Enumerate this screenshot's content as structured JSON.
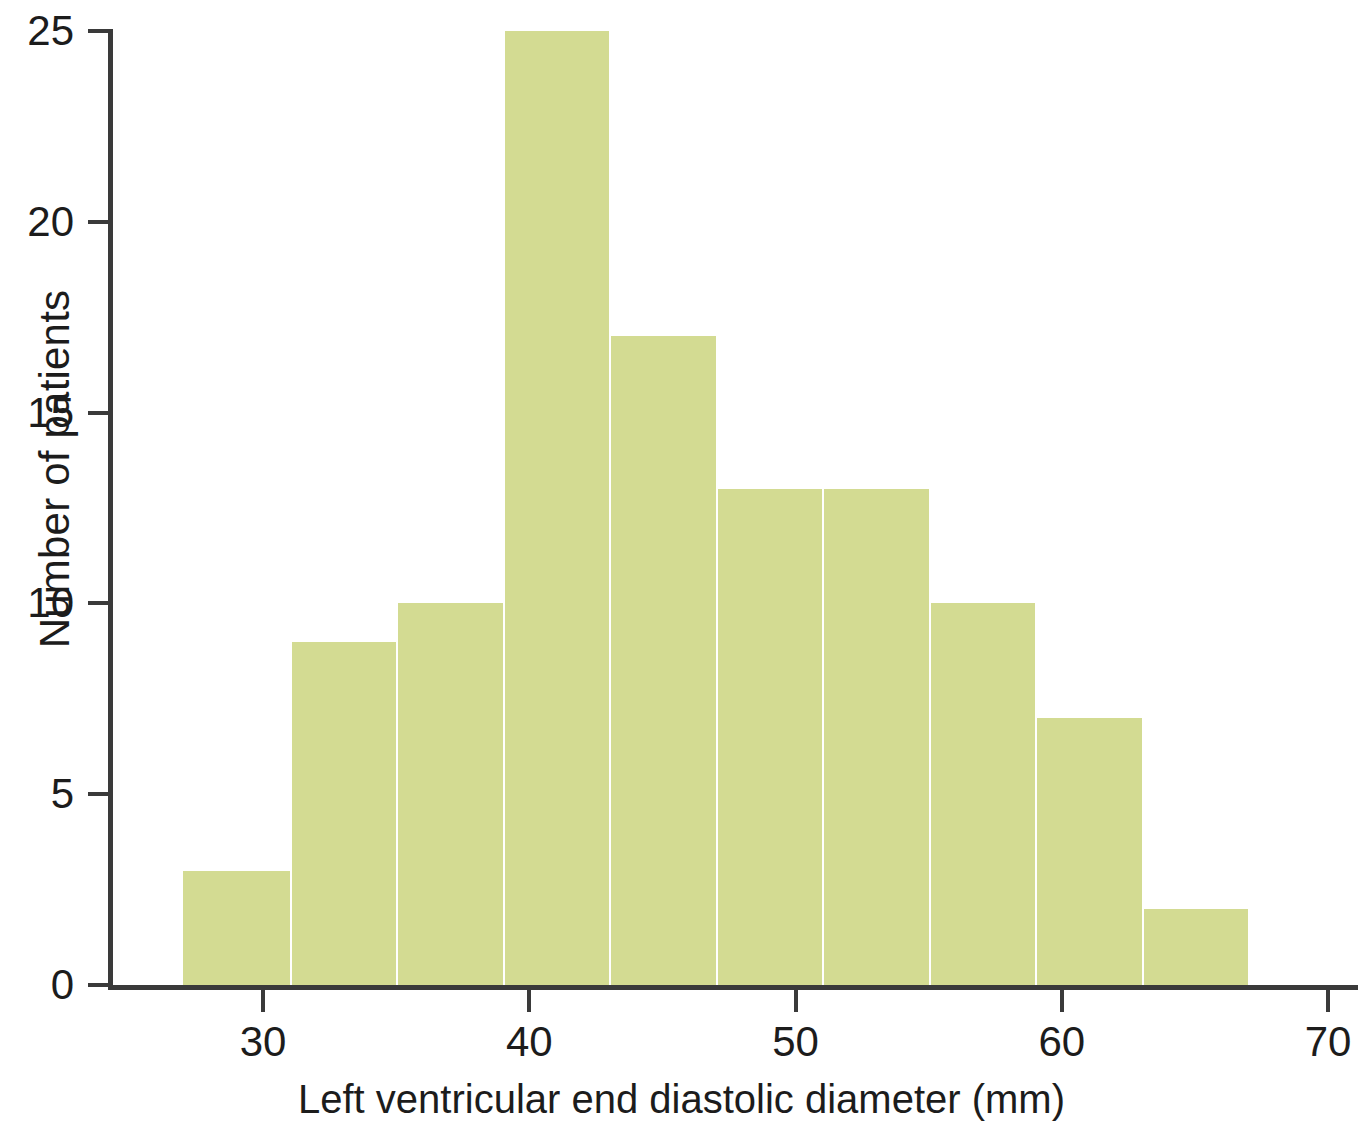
{
  "chart_data": {
    "type": "bar",
    "title": "",
    "subtitle": "",
    "xlabel": "Left ventricular end diastolic diameter (mm)",
    "ylabel": "Number of patients",
    "xlim": [
      25.2,
      71.5
    ],
    "ylim": [
      0,
      25
    ],
    "grid": false,
    "legend": null,
    "bin_width": 4,
    "categories": [
      "27-31",
      "31-35",
      "35-39",
      "39-43",
      "43-47",
      "47-51",
      "51-55",
      "55-59",
      "59-63",
      "63-67"
    ],
    "bin_edges": [
      27,
      31,
      35,
      39,
      43,
      47,
      51,
      55,
      59,
      63,
      67
    ],
    "values": [
      3,
      9,
      10,
      25,
      17,
      13,
      13,
      10,
      7,
      2
    ],
    "bars": [
      {
        "bin_start": 27,
        "bin_end": 31,
        "count": 3
      },
      {
        "bin_start": 31,
        "bin_end": 35,
        "count": 9
      },
      {
        "bin_start": 35,
        "bin_end": 39,
        "count": 10
      },
      {
        "bin_start": 39,
        "bin_end": 43,
        "count": 25
      },
      {
        "bin_start": 43,
        "bin_end": 47,
        "count": 17
      },
      {
        "bin_start": 47,
        "bin_end": 51,
        "count": 13
      },
      {
        "bin_start": 51,
        "bin_end": 55,
        "count": 13
      },
      {
        "bin_start": 55,
        "bin_end": 59,
        "count": 10
      },
      {
        "bin_start": 59,
        "bin_end": 63,
        "count": 7
      },
      {
        "bin_start": 63,
        "bin_end": 67,
        "count": 2
      }
    ],
    "x_ticks": [
      30,
      40,
      50,
      60,
      70
    ],
    "x_tick_labels": [
      "30",
      "40",
      "50",
      "60",
      "70"
    ],
    "y_ticks": [
      0,
      5,
      10,
      15,
      20,
      25
    ],
    "y_tick_labels": [
      "0",
      "5",
      "10",
      "15",
      "20",
      "25"
    ],
    "colors": {
      "bar_fill": "#d3db92",
      "bar_separator": "#ffffff",
      "axis": "#3a3a3a",
      "text": "#1c1c1c",
      "background": "#ffffff"
    }
  }
}
